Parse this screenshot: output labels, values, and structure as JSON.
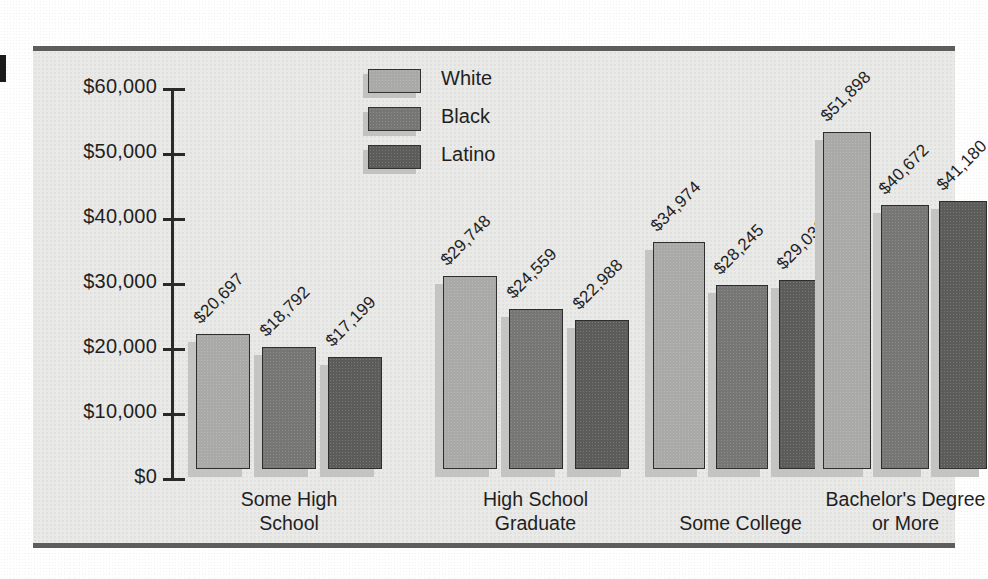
{
  "chart_data": {
    "type": "bar",
    "title": "",
    "xlabel": "",
    "ylabel": "",
    "ylim": [
      0,
      60000
    ],
    "grid": false,
    "legend_position": "top-center",
    "categories": [
      "Some High\nSchool",
      "High School\nGraduate",
      "Some College",
      "Bachelor's Degree\nor More"
    ],
    "ytick_labels": [
      "$60,000",
      "$50,000",
      "$40,000",
      "$30,000",
      "$20,000",
      "$10,000",
      "$0"
    ],
    "ytick_values": [
      60000,
      50000,
      40000,
      30000,
      20000,
      10000,
      0
    ],
    "series": [
      {
        "name": "White",
        "color": "#a9a9a7",
        "values": [
          20697,
          29748,
          34974,
          51898
        ],
        "labels": [
          "$20,697",
          "$29,748",
          "$34,974",
          "$51,898"
        ]
      },
      {
        "name": "Black",
        "color": "#767674",
        "values": [
          18792,
          24559,
          28245,
          40672
        ],
        "labels": [
          "$18,792",
          "$24,559",
          "$28,245",
          "$40,672"
        ]
      },
      {
        "name": "Latino",
        "color": "#5c5c5a",
        "values": [
          17199,
          22988,
          29038,
          41180
        ],
        "labels": [
          "$17,199",
          "$22,988",
          "$29,038",
          "$41,180"
        ]
      }
    ]
  },
  "legend": {
    "items": [
      {
        "label": "White",
        "color": "#a9a9a7"
      },
      {
        "label": "Black",
        "color": "#767674"
      },
      {
        "label": "Latino",
        "color": "#5c5c5a"
      }
    ]
  },
  "axis": {
    "y_labels": [
      "$60,000",
      "$50,000",
      "$40,000",
      "$30,000",
      "$20,000",
      "$10,000",
      "$0"
    ]
  },
  "categories": [
    "Some High\nSchool",
    "High School\nGraduate",
    "Some College",
    "Bachelor's Degree\nor More"
  ],
  "colors": {
    "plot_background": "#e9e9e7",
    "frame_rule": "#5d5d5d",
    "axis": "#2a2a2a",
    "text": "#1f1f1f",
    "bar_shadow": "#c4c4c2"
  }
}
